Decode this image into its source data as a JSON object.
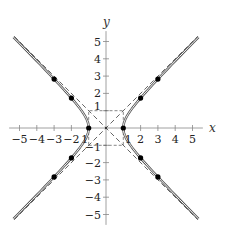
{
  "chart_data": {
    "type": "line",
    "title": "",
    "xlabel": "x",
    "ylabel": "y",
    "xlim": [
      -5.6,
      5.6
    ],
    "ylim": [
      -5.6,
      5.6
    ],
    "grid": false,
    "x_ticks": [
      -5,
      -4,
      -3,
      -2,
      -1,
      1,
      2,
      3,
      4,
      5
    ],
    "y_ticks": [
      -5,
      -4,
      -3,
      -2,
      -1,
      1,
      2,
      3,
      4,
      5
    ],
    "x_tick_labels": [
      "−5",
      "−4",
      "−3",
      "−2",
      "1",
      "1",
      "2",
      "3",
      "4",
      "5"
    ],
    "y_tick_labels": [
      "−5",
      "−4",
      "−3",
      "−2",
      "−1",
      "1",
      "2",
      "3",
      "4",
      "5"
    ],
    "series": [
      {
        "name": "hyperbola x^2 - y^2 = 1",
        "style": "double-line",
        "equation": "x^2 - y^2 = 1"
      },
      {
        "name": "asymptote y = x",
        "style": "dashed",
        "equation": "y = x"
      },
      {
        "name": "asymptote y = -x",
        "style": "dashed",
        "equation": "y = -x"
      },
      {
        "name": "fundamental rectangle",
        "style": "dashed",
        "corners": [
          [
            -1,
            -1
          ],
          [
            1,
            -1
          ],
          [
            1,
            1
          ],
          [
            -1,
            1
          ]
        ]
      }
    ],
    "points": [
      {
        "x": 1,
        "y": 0
      },
      {
        "x": -1,
        "y": 0
      },
      {
        "x": 2,
        "y": 1.73
      },
      {
        "x": 2,
        "y": -1.73
      },
      {
        "x": -2,
        "y": 1.73
      },
      {
        "x": -2,
        "y": -1.73
      },
      {
        "x": 3,
        "y": 2.83
      },
      {
        "x": 3,
        "y": -2.83
      },
      {
        "x": -3,
        "y": 2.83
      },
      {
        "x": -3,
        "y": -2.83
      }
    ],
    "colors": {
      "curve": "#555555",
      "dash": "#555555",
      "axis": "#888888",
      "point": "#000000"
    }
  }
}
